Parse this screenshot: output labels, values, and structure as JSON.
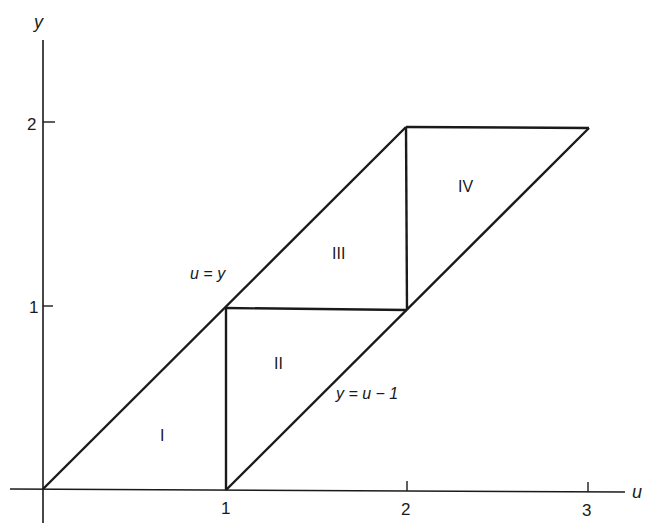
{
  "axes": {
    "x_label": "u",
    "y_label": "y",
    "x_ticks": [
      "1",
      "2",
      "3"
    ],
    "y_ticks": [
      "1",
      "2"
    ]
  },
  "regions": {
    "r1": "I",
    "r2": "II",
    "r3": "III",
    "r4": "IV"
  },
  "lines": {
    "upper": "u = y",
    "lower": "y = u − 1"
  },
  "colors": {
    "ink": "#1a1a1a",
    "background": "#ffffff"
  }
}
